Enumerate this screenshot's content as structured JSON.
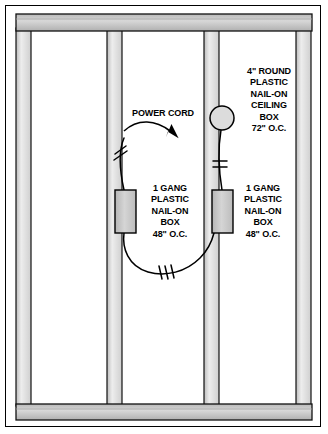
{
  "figure": {
    "background_color": "#ffffff",
    "border_color": "#000000"
  },
  "colors": {
    "lumber_fill": "#d4d4d4",
    "lumber_fill_light": "#e8e8e8",
    "lumber_edge": "#000000",
    "box_fill": "#c9c9c9",
    "plate_fill": "#c0c0c0",
    "cable_color": "#000000",
    "text_color": "#000000"
  },
  "labels": {
    "power_cord": "POWER CORD",
    "ceiling_box": "4\" ROUND\nPLASTIC\nNAIL-ON\nCEILING\nBOX\n72\" O.C.",
    "gang_box_left": "1 GANG\nPLASTIC\nNAIL-ON\nBOX\n48\" O.C.",
    "gang_box_right": "1 GANG\nPLASTIC\nNAIL-ON\nBOX\n48\" O.C."
  },
  "components": {
    "studs": [
      {
        "name": "stud-1",
        "x": 16,
        "width": 15
      },
      {
        "name": "stud-2",
        "x": 107,
        "width": 15
      },
      {
        "name": "stud-3",
        "x": 204,
        "width": 15
      },
      {
        "name": "stud-4",
        "x": 296,
        "width": 15
      }
    ],
    "top_plate": {
      "x": 16,
      "y": 14,
      "width": 296,
      "height": 17
    },
    "bottom_plate": {
      "x": 16,
      "y": 404,
      "width": 296,
      "height": 16
    },
    "gang_box_left": {
      "x": 115,
      "y": 190,
      "width": 21,
      "height": 43
    },
    "gang_box_right": {
      "x": 212,
      "y": 190,
      "width": 21,
      "height": 43
    },
    "ceiling_box": {
      "cx": 222,
      "cy": 118,
      "r": 12
    }
  },
  "cable_ticks": {
    "power_cord_ticks": 2,
    "lower_run_ticks": 3,
    "ceiling_drop_ticks": 2
  },
  "dimensions": {
    "gang_box_height_label": "48\" O.C.",
    "ceiling_box_height_label": "72\" O.C."
  }
}
